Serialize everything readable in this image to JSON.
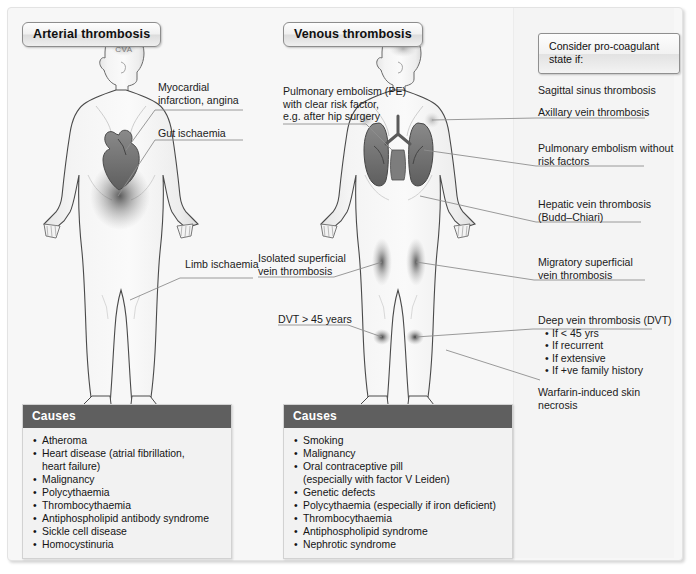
{
  "headers": {
    "arterial": "Arterial thrombosis",
    "venous": "Venous thrombosis"
  },
  "arterial_labels": {
    "cva": "CVA",
    "mi": "Myocardial\ninfarction, angina",
    "gut": "Gut ischaemia",
    "limb": "Limb ischaemia"
  },
  "venous_left_labels": {
    "pe_risk": "Pulmonary embolism (PE)\nwith clear risk factor,\ne.g. after hip surgery",
    "isolated": "Isolated superficial\nvein thrombosis",
    "dvt45": "DVT > 45 years"
  },
  "consider_box": {
    "text": "Consider pro-coagulant\nstate if:"
  },
  "venous_right_labels": {
    "sagittal": "Sagittal sinus thrombosis",
    "axillary": "Axillary vein thrombosis",
    "pe_norisk": "Pulmonary embolism without\nrisk factors",
    "hepatic": "Hepatic vein thrombosis\n(Budd–Chiari)",
    "migratory": "Migratory superficial\nvein thrombosis",
    "warfarin": "Warfarin-induced skin\nnecrosis"
  },
  "dvt_block": {
    "heading": "Deep vein thrombosis (DVT)",
    "items": [
      "If < 45 yrs",
      "If recurrent",
      "If extensive",
      "If +ve family history"
    ]
  },
  "causes_arterial": {
    "title": "Causes",
    "items": [
      {
        "text": "Atheroma",
        "cont": false
      },
      {
        "text": "Heart disease (atrial fibrillation,",
        "cont": false
      },
      {
        "text": "heart failure)",
        "cont": true
      },
      {
        "text": "Malignancy",
        "cont": false
      },
      {
        "text": "Polycythaemia",
        "cont": false
      },
      {
        "text": "Thrombocythaemia",
        "cont": false
      },
      {
        "text": "Antiphospholipid antibody syndrome",
        "cont": false
      },
      {
        "text": "Sickle cell disease",
        "cont": false
      },
      {
        "text": "Homocystinuria",
        "cont": false
      }
    ]
  },
  "causes_venous": {
    "title": "Causes",
    "items": [
      {
        "text": "Smoking",
        "cont": false
      },
      {
        "text": "Malignancy",
        "cont": false
      },
      {
        "text": "Oral contraceptive pill",
        "cont": false
      },
      {
        "text": "(especially with factor V Leiden)",
        "cont": true
      },
      {
        "text": "Genetic defects",
        "cont": false
      },
      {
        "text": "Polycythaemia (especially if iron deficient)",
        "cont": false
      },
      {
        "text": "Thrombocythaemia",
        "cont": false
      },
      {
        "text": "Antiphospholipid syndrome",
        "cont": false
      },
      {
        "text": "Nephrotic syndrome",
        "cont": false
      }
    ]
  },
  "colors": {
    "panel_bg": "#f7f7f7",
    "causes_header": "#5f5f5f",
    "body_fill": "#f0f0f0",
    "organ_dark": "#6e6e6e",
    "leader_line": "#8f8f8f"
  }
}
